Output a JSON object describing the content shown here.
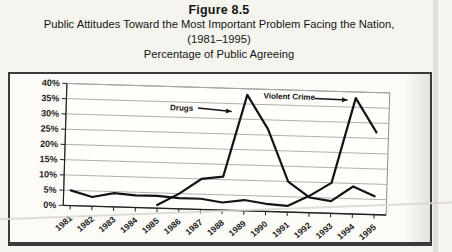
{
  "figure": {
    "label": "Figure 8.5",
    "title": "Public Attitudes Toward the Most Important Problem Facing the Nation,",
    "years": "(1981–1995)",
    "subtitle": "Percentage of Public Agreeing"
  },
  "chart_data": {
    "type": "line",
    "title": "Public Attitudes Toward the Most Important Problem Facing the Nation, (1981–1995)",
    "subtitle": "Percentage of Public Agreeing",
    "xlabel": "",
    "ylabel": "Percentage of Public Agreeing",
    "x": [
      1981,
      1982,
      1983,
      1984,
      1985,
      1986,
      1987,
      1988,
      1989,
      1990,
      1991,
      1992,
      1993,
      1994,
      1995
    ],
    "x_labels": [
      "1981",
      "1982",
      "1983",
      "1984",
      "1985",
      "1986",
      "1987",
      "1988",
      "1989",
      "1990",
      "1991",
      "1992",
      "1993",
      "1994",
      "1995"
    ],
    "series": [
      {
        "name": "Drugs",
        "values": [
          null,
          null,
          null,
          null,
          1,
          5,
          10,
          11,
          38,
          27,
          10,
          5,
          4,
          9,
          6
        ]
      },
      {
        "name": "Violent Crime",
        "values": [
          5,
          3,
          4.5,
          4,
          4,
          3.5,
          3.5,
          2.5,
          3.5,
          2.5,
          2,
          5.5,
          10,
          38,
          27
        ]
      }
    ],
    "ylim": [
      0,
      40
    ],
    "yticks": [
      0,
      5,
      10,
      15,
      20,
      25,
      30,
      35,
      40
    ],
    "ytick_labels": [
      "0%",
      "5%",
      "10%",
      "15%",
      "20%",
      "25%",
      "30%",
      "35%",
      "40%"
    ],
    "grid": "horizontal",
    "legend": "none (in-chart arrow annotations)",
    "annotations": [
      {
        "text": "Drugs",
        "anchor": "end",
        "text_year": 1986.53,
        "text_value": 32.2,
        "arrow": {
          "from": [
            1986.75,
            33.2
          ],
          "to": [
            1988.3,
            32.4
          ]
        }
      },
      {
        "text": "Violent Crime",
        "anchor": "start",
        "text_year": 1989.75,
        "text_value": 37.0,
        "arrow": {
          "from": [
            1992.1,
            37.5
          ],
          "to": [
            1993.62,
            37.3
          ]
        }
      }
    ],
    "colors": {
      "ink": "#141414",
      "grid": "#a8a8a8",
      "axis": "#222222",
      "frame": "#8f8f8f"
    }
  }
}
